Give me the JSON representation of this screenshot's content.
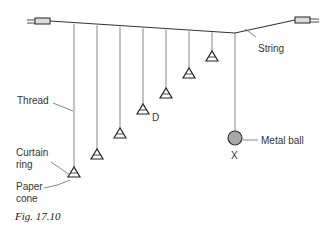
{
  "figure": {
    "caption": "Fig. 17.10",
    "labels": {
      "string": "String",
      "thread": "Thread",
      "d": "D",
      "metal_ball": "Metal ball",
      "x": "X",
      "curtain_ring_1": "Curtain",
      "curtain_ring_2": "ring",
      "paper_cone_1": "Paper",
      "paper_cone_2": "cone"
    },
    "pendulums": [
      {
        "name": "pendulum-1",
        "x": 74,
        "bottom": 176
      },
      {
        "name": "pendulum-2",
        "x": 97,
        "bottom": 158
      },
      {
        "name": "pendulum-3",
        "x": 120,
        "bottom": 137
      },
      {
        "name": "pendulum-d",
        "x": 143,
        "bottom": 113
      },
      {
        "name": "pendulum-5",
        "x": 166,
        "bottom": 97
      },
      {
        "name": "pendulum-6",
        "x": 189,
        "bottom": 77
      },
      {
        "name": "pendulum-7",
        "x": 212,
        "bottom": 60
      }
    ],
    "driver": {
      "name": "pendulum-x-metal-ball",
      "x": 235,
      "ball_cy": 138,
      "r": 7,
      "color": "#aaaaaa"
    }
  }
}
